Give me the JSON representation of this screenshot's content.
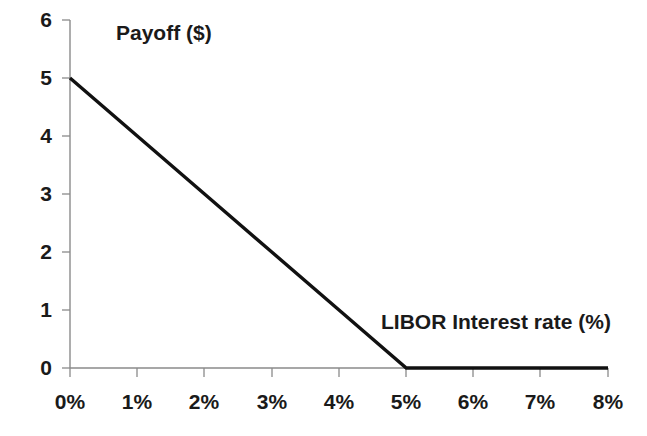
{
  "chart_data": {
    "type": "line",
    "title": "",
    "xlabel": "LIBOR Interest rate (%)",
    "ylabel": "Payoff ($)",
    "xlim": [
      0,
      8
    ],
    "ylim": [
      0,
      6
    ],
    "grid": false,
    "legend": null,
    "x_tick_labels": [
      "0%",
      "1%",
      "2%",
      "3%",
      "4%",
      "5%",
      "6%",
      "7%",
      "8%"
    ],
    "x_tick_values": [
      0,
      1,
      2,
      3,
      4,
      5,
      6,
      7,
      8
    ],
    "y_tick_labels": [
      "0",
      "1",
      "2",
      "3",
      "4",
      "5",
      "6"
    ],
    "y_tick_values": [
      0,
      1,
      2,
      3,
      4,
      5,
      6
    ],
    "series": [
      {
        "name": "Payoff",
        "color": "#111111",
        "x": [
          0,
          1,
          2,
          3,
          4,
          5,
          6,
          7,
          8
        ],
        "values": [
          5,
          4,
          3,
          2,
          1,
          0,
          0,
          0,
          0
        ]
      }
    ],
    "annotations": [
      {
        "text": "Payoff ($)",
        "x": 1.7,
        "y": 5.6
      },
      {
        "text": "LIBOR Interest rate (%)",
        "x": 4.65,
        "y": 0.95
      }
    ]
  },
  "axes": {
    "y_title": "Payoff ($)",
    "x_title": "LIBOR Interest rate (%)",
    "y_ticks": [
      {
        "label": "6"
      },
      {
        "label": "5"
      },
      {
        "label": "4"
      },
      {
        "label": "3"
      },
      {
        "label": "2"
      },
      {
        "label": "1"
      },
      {
        "label": "0"
      }
    ],
    "x_ticks": [
      {
        "label": "0%"
      },
      {
        "label": "1%"
      },
      {
        "label": "2%"
      },
      {
        "label": "3%"
      },
      {
        "label": "4%"
      },
      {
        "label": "5%"
      },
      {
        "label": "6%"
      },
      {
        "label": "7%"
      },
      {
        "label": "8%"
      }
    ]
  },
  "colors": {
    "background": "#ffffff",
    "axis": "#8a8a8a",
    "data_line": "#111111",
    "text": "#1a1a1a"
  }
}
